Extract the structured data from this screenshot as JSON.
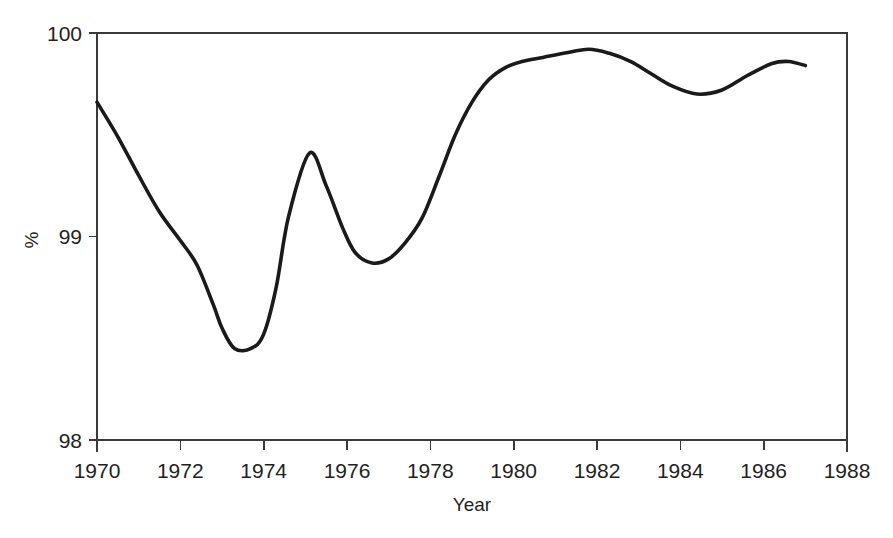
{
  "chart_data": {
    "type": "line",
    "title": "",
    "subtitle": "",
    "xlabel": "Year",
    "ylabel": "%",
    "xlim": [
      1970,
      1988
    ],
    "ylim": [
      98,
      100
    ],
    "grid": false,
    "legend": false,
    "legend_position": "none",
    "line_color": "#1a1a1a",
    "x_ticks": [
      1970,
      1972,
      1974,
      1976,
      1978,
      1980,
      1982,
      1984,
      1986,
      1988
    ],
    "x_tick_labels": [
      "1970",
      "1972",
      "1974",
      "1976",
      "1978",
      "1980",
      "1982",
      "1984",
      "1986",
      "1988"
    ],
    "y_ticks": [
      98,
      99,
      100
    ],
    "y_tick_labels": [
      "98",
      "99",
      "100"
    ],
    "series": [
      {
        "name": "percent",
        "x": [
          1970.0,
          1970.5,
          1971.0,
          1971.5,
          1972.0,
          1972.4,
          1972.8,
          1973.0,
          1973.3,
          1973.7,
          1974.0,
          1974.3,
          1974.6,
          1975.1,
          1975.5,
          1975.9,
          1976.2,
          1976.6,
          1977.0,
          1977.4,
          1977.8,
          1978.2,
          1978.6,
          1979.0,
          1979.4,
          1979.8,
          1980.2,
          1980.7,
          1981.2,
          1981.8,
          1982.3,
          1982.8,
          1983.3,
          1983.8,
          1984.4,
          1985.0,
          1985.6,
          1986.2,
          1986.6,
          1987.0
        ],
        "y": [
          99.66,
          99.49,
          99.3,
          99.12,
          98.98,
          98.86,
          98.66,
          98.55,
          98.45,
          98.45,
          98.52,
          98.75,
          99.1,
          99.41,
          99.25,
          99.04,
          98.92,
          98.87,
          98.89,
          98.97,
          99.09,
          99.29,
          99.5,
          99.66,
          99.77,
          99.83,
          99.86,
          99.88,
          99.9,
          99.92,
          99.9,
          99.86,
          99.8,
          99.74,
          99.7,
          99.72,
          99.79,
          99.85,
          99.86,
          99.84
        ]
      }
    ],
    "annotations": []
  },
  "axis": {
    "y_title": "%",
    "x_title": "Year"
  }
}
